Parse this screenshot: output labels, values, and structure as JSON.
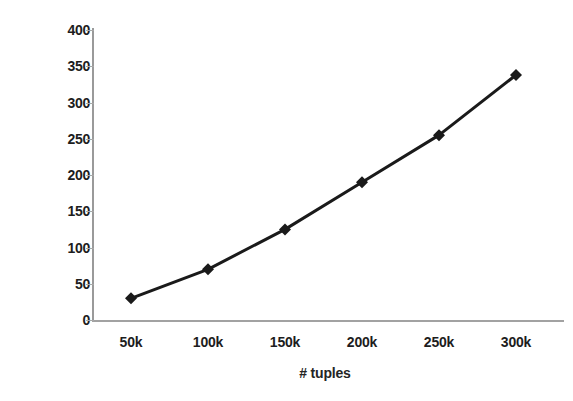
{
  "chart_data": {
    "type": "line",
    "title": "",
    "categories": [
      "50k",
      "100k",
      "150k",
      "200k",
      "250k",
      "300k"
    ],
    "values": [
      30,
      70,
      125,
      190,
      255,
      338
    ],
    "series": [
      {
        "name": "Running time",
        "values": [
          30,
          70,
          125,
          190,
          255,
          338
        ]
      }
    ],
    "xlabel": "# tuples",
    "ylabel": "Running time (mins)",
    "ylim": [
      0,
      400
    ],
    "yticks": [
      0,
      50,
      100,
      150,
      200,
      250,
      300,
      350,
      400
    ],
    "yticklabels": [
      "0",
      "50",
      "100",
      "150",
      "200",
      "250",
      "300",
      "350",
      "400"
    ],
    "grid": false,
    "legend": false,
    "legend_position": "none",
    "marker": "diamond",
    "line_color": "#1a1a1a",
    "marker_color": "#1a1a1a",
    "background_color": "#ffffff",
    "axis_color": "#9a9a9a"
  }
}
